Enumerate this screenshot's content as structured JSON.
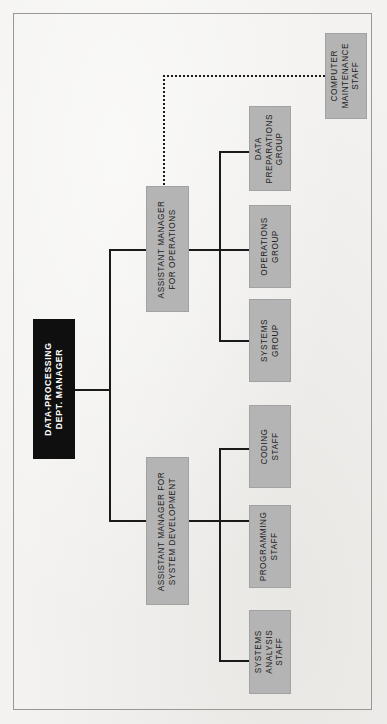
{
  "diagram": {
    "type": "organization-chart",
    "orientation": "rotated-90-counterclockwise",
    "colors": {
      "page_background": "#f3f2f0",
      "frame_border": "#9a9894",
      "node_fill": "#b4b4b4",
      "node_border": "#a2a2a2",
      "root_fill": "#0f0f0f",
      "root_text": "#ffffff",
      "node_text": "#1d1d1d",
      "connector": "#1a1a1a"
    },
    "nodes": {
      "root": {
        "label": "DATA-PROCESSING\nDEPT. MANAGER",
        "level": 0
      },
      "assistant_operations": {
        "label": "ASSISTANT MANAGER\nFOR OPERATIONS",
        "level": 1
      },
      "assistant_development": {
        "label": "ASSISTANT MANAGER FOR\nSYSTEM DEVELOPMENT",
        "level": 1
      },
      "computer_maintenance": {
        "label": "COMPUTER\nMAINTENANCE\nSTAFF",
        "level": 2,
        "relation": "dotted"
      },
      "data_preparations": {
        "label": "DATA\nPREPARATIONS\nGROUP",
        "level": 2
      },
      "operations_group": {
        "label": "OPERATIONS\nGROUP",
        "level": 2
      },
      "systems_group": {
        "label": "SYSTEMS\nGROUP",
        "level": 2
      },
      "coding_staff": {
        "label": "CODING\nSTAFF",
        "level": 2
      },
      "programming_staff": {
        "label": "PROGRAMMING\nSTAFF",
        "level": 2
      },
      "systems_analysis_staff": {
        "label": "SYSTEMS\nANALYSIS\nSTAFF",
        "level": 2
      }
    },
    "edges": [
      {
        "from": "root",
        "to": "assistant_operations",
        "style": "solid"
      },
      {
        "from": "root",
        "to": "assistant_development",
        "style": "solid"
      },
      {
        "from": "assistant_operations",
        "to": "data_preparations",
        "style": "solid"
      },
      {
        "from": "assistant_operations",
        "to": "operations_group",
        "style": "solid"
      },
      {
        "from": "assistant_operations",
        "to": "systems_group",
        "style": "solid"
      },
      {
        "from": "assistant_operations",
        "to": "computer_maintenance",
        "style": "dotted"
      },
      {
        "from": "assistant_development",
        "to": "coding_staff",
        "style": "solid"
      },
      {
        "from": "assistant_development",
        "to": "programming_staff",
        "style": "solid"
      },
      {
        "from": "assistant_development",
        "to": "systems_analysis_staff",
        "style": "solid"
      }
    ]
  }
}
